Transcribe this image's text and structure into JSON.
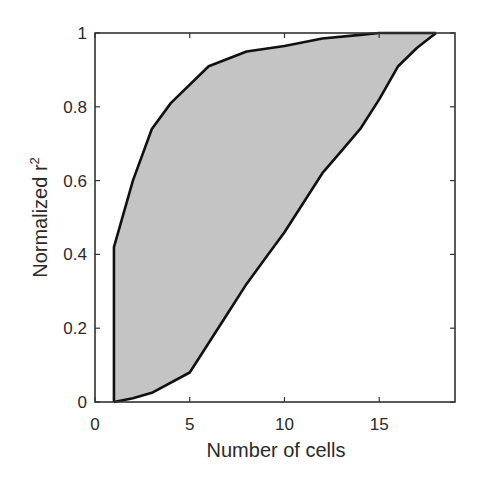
{
  "chart_data": {
    "type": "area",
    "title": "",
    "xlabel": "Number of cells",
    "ylabel": "Normalized r",
    "ylabel_superscript": "2",
    "xlim": [
      0,
      19
    ],
    "ylim": [
      0,
      1
    ],
    "xticks": [
      0,
      5,
      10,
      15
    ],
    "xtick_labels": [
      "0",
      "5",
      "10",
      "15"
    ],
    "yticks": [
      0,
      0.2,
      0.4,
      0.6,
      0.8,
      1
    ],
    "ytick_labels": [
      "0",
      "0.2",
      "0.4",
      "0.6",
      "0.8",
      "1"
    ],
    "grid": false,
    "legend": null,
    "fill_color": "#c4c4c4",
    "line_color": "#111111",
    "series": [
      {
        "name": "upper bound",
        "x": [
          1,
          2,
          3,
          4,
          6,
          8,
          10,
          12,
          14,
          15,
          18
        ],
        "values": [
          0.42,
          0.6,
          0.74,
          0.81,
          0.91,
          0.95,
          0.965,
          0.985,
          0.995,
          1.0,
          1.0
        ]
      },
      {
        "name": "lower bound",
        "x": [
          1,
          2,
          3,
          5,
          6,
          7,
          8,
          9,
          10,
          11,
          12,
          13,
          14,
          15,
          16,
          17,
          18
        ],
        "values": [
          0.0,
          0.01,
          0.025,
          0.08,
          0.16,
          0.24,
          0.32,
          0.39,
          0.46,
          0.54,
          0.62,
          0.68,
          0.74,
          0.82,
          0.91,
          0.96,
          1.0
        ]
      }
    ]
  }
}
